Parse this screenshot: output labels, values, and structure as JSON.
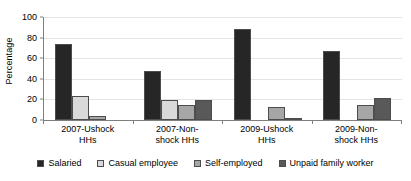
{
  "chart_data": {
    "type": "bar",
    "title": "",
    "xlabel": "",
    "ylabel": "Percentage",
    "ylim": [
      0,
      100
    ],
    "yticks": [
      0,
      20,
      40,
      60,
      80,
      100
    ],
    "grid": true,
    "legend_position": "bottom",
    "categories": [
      "2007-Ushock\nHHs",
      "2007-Non-\nshock HHs",
      "2009-Ushock\nHHs",
      "2009-Non-\nshock HHs"
    ],
    "series": [
      {
        "name": "Salaried",
        "color": "#262626",
        "values": [
          74,
          47.5,
          88,
          67
        ]
      },
      {
        "name": "Casual employee",
        "color": "#d9d9d9",
        "values": [
          23,
          19,
          0,
          0
        ]
      },
      {
        "name": "Self-employed",
        "color": "#a6a6a6",
        "values": [
          3.5,
          15,
          13,
          15
        ]
      },
      {
        "name": "Unpaid family worker",
        "color": "#595959",
        "values": [
          0,
          19.5,
          2,
          21.5
        ]
      }
    ]
  },
  "axes": {
    "y_title": "Percentage",
    "y_tick_labels": [
      "100",
      "80",
      "60",
      "40",
      "20",
      "0"
    ]
  },
  "legend": {
    "items": [
      {
        "label": "Salaried",
        "color": "#262626"
      },
      {
        "label": "Casual employee",
        "color": "#d9d9d9"
      },
      {
        "label": "Self-employed",
        "color": "#a6a6a6"
      },
      {
        "label": "Unpaid family worker",
        "color": "#595959"
      }
    ]
  }
}
